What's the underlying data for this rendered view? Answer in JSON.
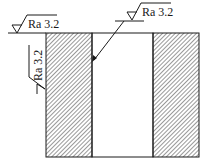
{
  "diagram": {
    "type": "engineering-section-drawing",
    "annotations": {
      "top_left": {
        "symbol": "surface-roughness",
        "text": "Ra 3.2",
        "applies_to": "top surface"
      },
      "top_right": {
        "symbol": "surface-roughness",
        "text": "Ra 3.2",
        "applies_to": "inner bore surface (via leader arrow)"
      },
      "left_vertical": {
        "symbol": "surface-roughness",
        "text": "Ra 3.2",
        "applies_to": "left outer surface"
      }
    },
    "colors": {
      "line": "#1a1a1a",
      "hatch": "#333333",
      "background": "#ffffff"
    }
  }
}
